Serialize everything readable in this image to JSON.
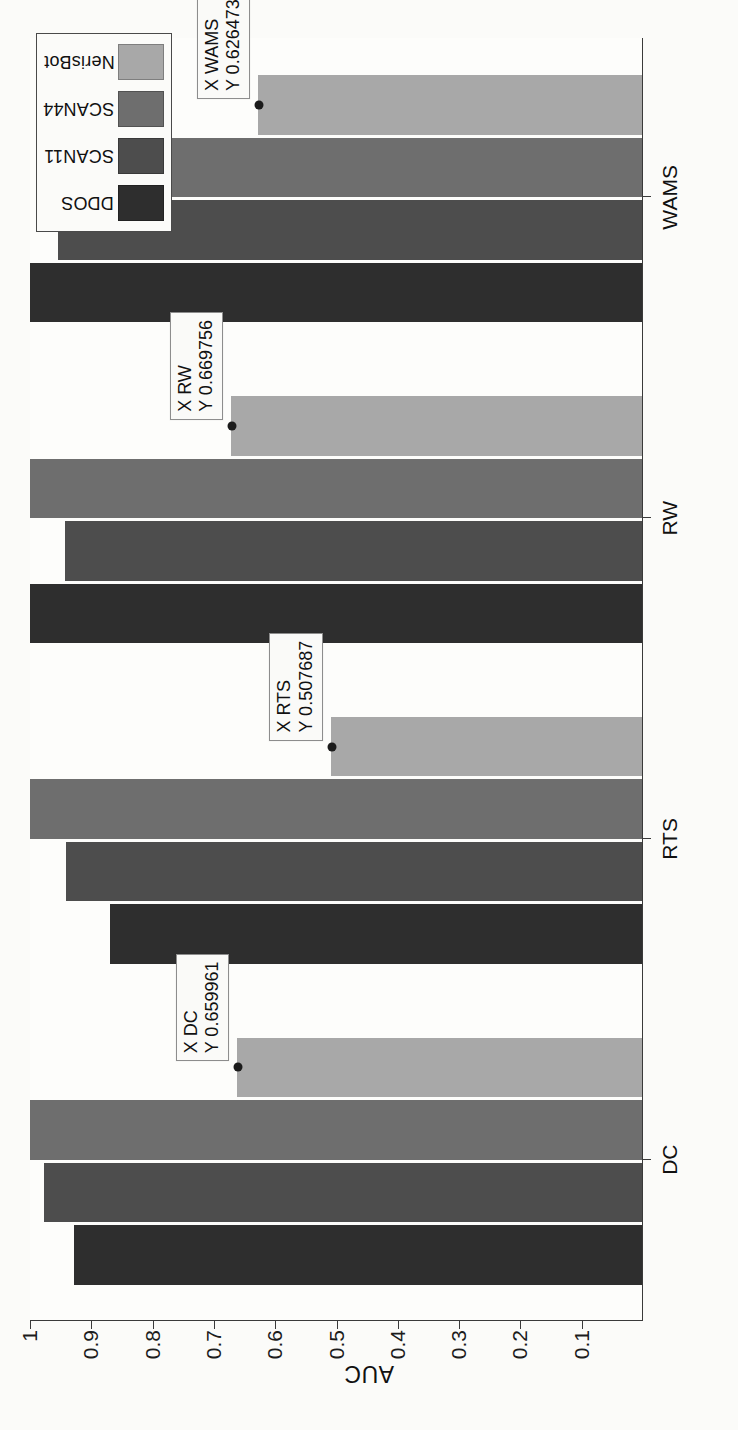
{
  "chart_data": {
    "type": "bar",
    "orientation": "rotated-90-horizontal-page",
    "title": "",
    "subtitle": "",
    "xlabel": "",
    "ylabel": "AUC",
    "categories": [
      "DC",
      "RTS",
      "RW",
      "WAMS"
    ],
    "series": [
      {
        "name": "DDOS",
        "color": "#2e2e2e",
        "values": [
          0.927,
          0.868,
          0.999,
          0.999
        ]
      },
      {
        "name": "SCAN11",
        "color": "#4d4d4d",
        "values": [
          0.975,
          0.94,
          0.941,
          0.952
        ]
      },
      {
        "name": "SCAN44",
        "color": "#6e6e6e",
        "values": [
          0.999,
          0.999,
          0.999,
          0.92
        ]
      },
      {
        "name": "NerisBot",
        "color": "#a8a8a8",
        "values": [
          0.659961,
          0.507687,
          0.669756,
          0.626473
        ]
      }
    ],
    "ylim": [
      0,
      1
    ],
    "yticks": [
      1,
      0.9,
      0.8,
      0.7,
      0.6,
      0.5,
      0.4,
      0.3,
      0.2,
      0.1
    ],
    "ytick_labels": [
      "1",
      "0.9",
      "0.8",
      "0.7",
      "0.6",
      "0.5",
      "0.4",
      "0.3",
      "0.2",
      "0.1"
    ],
    "grid": false,
    "legend_position": "top-right",
    "annotations": [
      {
        "label": "datatip-dc",
        "x_label": "X",
        "x_value": "DC",
        "y_label": "Y",
        "y_value": "0.659961",
        "series": "NerisBot",
        "category": "DC"
      },
      {
        "label": "datatip-rts",
        "x_label": "X",
        "x_value": "RTS",
        "y_label": "Y",
        "y_value": "0.507687",
        "series": "NerisBot",
        "category": "RTS"
      },
      {
        "label": "datatip-rw",
        "x_label": "X",
        "x_value": "RW",
        "y_label": "Y",
        "y_value": "0.669756",
        "series": "NerisBot",
        "category": "RW"
      },
      {
        "label": "datatip-wams",
        "x_label": "X",
        "x_value": "WAMS",
        "y_label": "Y",
        "y_value": "0.626473",
        "series": "NerisBot",
        "category": "WAMS"
      }
    ]
  },
  "axis": {
    "y_title": "AUC",
    "ticks": [
      "1",
      "0.9",
      "0.8",
      "0.7",
      "0.6",
      "0.5",
      "0.4",
      "0.3",
      "0.2",
      "0.1"
    ],
    "categories": [
      "DC",
      "RTS",
      "RW",
      "WAMS"
    ]
  },
  "legend": {
    "entries": [
      {
        "label": "DDOS",
        "swatch": "#2e2e2e"
      },
      {
        "label": "SCAN11",
        "swatch": "#4d4d4d"
      },
      {
        "label": "SCAN44",
        "swatch": "#6e6e6e"
      },
      {
        "label": "NerisBot",
        "swatch": "#a8a8a8"
      }
    ]
  },
  "datatips": [
    {
      "line1": "X DC",
      "line2": "Y 0.659961"
    },
    {
      "line1": "X RTS",
      "line2": "Y 0.507687"
    },
    {
      "line1": "X RW",
      "line2": "Y 0.669756"
    },
    {
      "line1": "X WAMS",
      "line2": "Y 0.626473"
    }
  ],
  "page_bleed": [
    "the repor. from",
    "ned in several",
    "Attack on different",
    "the two case base on",
    "of these anomalies is presented",
    "the  thro-spatial"
  ]
}
